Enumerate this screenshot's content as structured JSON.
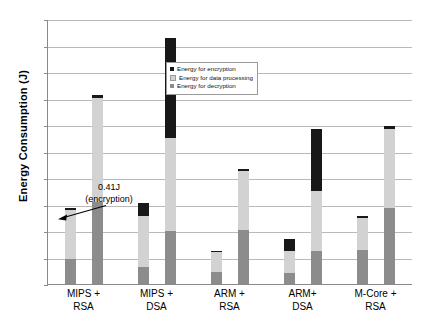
{
  "chart_data": {
    "type": "bar",
    "title": "",
    "xlabel": "",
    "ylabel": "Energy Consumption (J)",
    "ylim": [
      0,
      200
    ],
    "yticks": [
      0,
      20,
      40,
      60,
      80,
      100,
      120,
      140,
      160,
      180,
      200
    ],
    "grid": true,
    "legend_position": "upper-center",
    "stacked": true,
    "categories": [
      "MIPS + RSA",
      "MIPS + DSA",
      "ARM + RSA",
      "ARM+ DSA",
      "M-Core + RSA"
    ],
    "category_lines": [
      [
        "MIPS +",
        "RSA"
      ],
      [
        "MIPS +",
        "DSA"
      ],
      [
        "ARM +",
        "RSA"
      ],
      [
        "ARM+",
        "DSA"
      ],
      [
        "M-Core +",
        "RSA"
      ]
    ],
    "series": [
      {
        "name": "Energy for encryption",
        "color": "#181818"
      },
      {
        "name": "Energy for data processing",
        "color": "#d2d2d2"
      },
      {
        "name": "Energy for decryption",
        "color": "#8c8c8c"
      }
    ],
    "groups": [
      {
        "category": "MIPS + RSA",
        "bars": [
          {
            "total": 57.0,
            "decryption": 19.0,
            "data_processing": 37.6,
            "encryption": 0.41
          },
          {
            "total": 142.5,
            "decryption": 62.0,
            "data_processing": 78.5,
            "encryption": 2.0
          }
        ]
      },
      {
        "category": "MIPS + DSA",
        "bars": [
          {
            "total": 61.5,
            "decryption": 13.0,
            "data_processing": 38.5,
            "encryption": 10.0
          },
          {
            "total": 186.0,
            "decryption": 40.0,
            "data_processing": 70.0,
            "encryption": 76.0
          }
        ]
      },
      {
        "category": "ARM + RSA",
        "bars": [
          {
            "total": 25.0,
            "decryption": 9.0,
            "data_processing": 15.8,
            "encryption": 0.2
          },
          {
            "total": 87.0,
            "decryption": 41.0,
            "data_processing": 44.5,
            "encryption": 1.5
          }
        ]
      },
      {
        "category": "ARM+ DSA",
        "bars": [
          {
            "total": 34.0,
            "decryption": 8.0,
            "data_processing": 17.0,
            "encryption": 9.0
          },
          {
            "total": 117.0,
            "decryption": 25.0,
            "data_processing": 45.0,
            "encryption": 47.0
          }
        ]
      },
      {
        "category": "M-Core + RSA",
        "bars": [
          {
            "total": 51.0,
            "decryption": 26.0,
            "data_processing": 24.8,
            "encryption": 0.2
          },
          {
            "total": 119.0,
            "decryption": 57.0,
            "data_processing": 60.0,
            "encryption": 2.0
          }
        ]
      }
    ],
    "annotations": [
      {
        "text_lines": [
          "0.41J",
          "(encryption)"
        ],
        "points_to": "MIPS + RSA, first bar, encryption segment"
      }
    ]
  }
}
